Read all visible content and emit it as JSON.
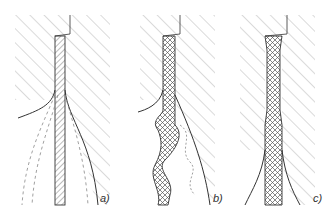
{
  "figure": {
    "panels": [
      {
        "id": "a",
        "label": "a)",
        "state": "straight strip with dashed outline of deflected position"
      },
      {
        "id": "b",
        "label": "b)",
        "state": "strip buckled into a wavy shape, dotted outline of alternative wave"
      },
      {
        "id": "c",
        "label": "c)",
        "state": "thick cross-hatched strip with necked section, splayed outer lines"
      }
    ],
    "colors": {
      "line": "#333333",
      "hatch": "#b0b0b0",
      "dashed": "#888888"
    }
  }
}
